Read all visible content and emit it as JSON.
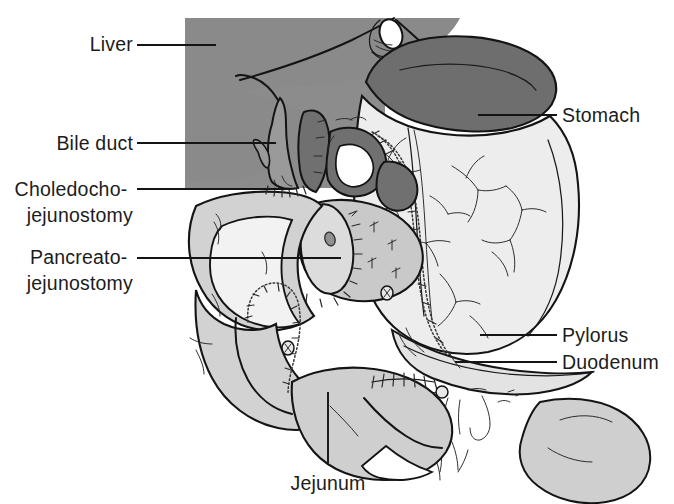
{
  "figure": {
    "background_color": "#ffffff",
    "width": 674,
    "height": 504
  },
  "palette": {
    "ink": "#141414",
    "liver_block": "#8c8c8c",
    "liver_organ": "#8a8a8a",
    "stomach_dark": "#6e6e6e",
    "bile_duct": "#9a9a9a",
    "duct_dark": "#707070",
    "bowel_mid": "#c9c9c9",
    "bowel_light": "#e3e3e3",
    "stomach_body": "#ededed",
    "pancreas_cut": "#cfcfcf",
    "white": "#ffffff"
  },
  "labels": [
    {
      "id": "liver",
      "name": "Liver",
      "lines": [
        "Liver"
      ],
      "side": "left",
      "text_anchor": "end",
      "text_x": 133,
      "text_y": 51,
      "leader": {
        "x1": 137,
        "y1": 45,
        "x2": 216,
        "y2": 45
      }
    },
    {
      "id": "bile-duct",
      "name": "Bile duct",
      "lines": [
        "Bile duct"
      ],
      "side": "left",
      "text_anchor": "end",
      "text_x": 133,
      "text_y": 150,
      "leader": {
        "x1": 137,
        "y1": 143,
        "x2": 276,
        "y2": 143
      }
    },
    {
      "id": "choledochojejunostomy",
      "name": "Choledochojejunostomy",
      "lines": [
        "Choledocho-",
        "jejunostomy"
      ],
      "side": "left",
      "text_anchor": "end",
      "text_x": 133,
      "text_y": 196,
      "line_height": 26,
      "leader": {
        "x1": 137,
        "y1": 189,
        "x2": 290,
        "y2": 189
      }
    },
    {
      "id": "pancreatojejunostomy",
      "name": "Pancreatojejunostomy",
      "lines": [
        "Pancreato-",
        "jejunostomy"
      ],
      "side": "left",
      "text_anchor": "end",
      "text_x": 133,
      "text_y": 264,
      "line_height": 26,
      "leader": {
        "x1": 137,
        "y1": 258,
        "x2": 341,
        "y2": 258
      }
    },
    {
      "id": "stomach",
      "name": "Stomach",
      "lines": [
        "Stomach"
      ],
      "side": "right",
      "text_anchor": "start",
      "text_x": 562,
      "text_y": 122,
      "leader": {
        "x1": 478,
        "y1": 115,
        "x2": 557,
        "y2": 115
      }
    },
    {
      "id": "pylorus",
      "name": "Pylorus",
      "lines": [
        "Pylorus"
      ],
      "side": "right",
      "text_anchor": "start",
      "text_x": 562,
      "text_y": 342,
      "leader": {
        "x1": 480,
        "y1": 335,
        "x2": 557,
        "y2": 335
      }
    },
    {
      "id": "duodenum",
      "name": "Duodenum",
      "lines": [
        "Duodenum"
      ],
      "side": "right",
      "text_anchor": "start",
      "text_x": 562,
      "text_y": 369,
      "leader": {
        "x1": 455,
        "y1": 362,
        "x2": 557,
        "y2": 362
      }
    },
    {
      "id": "jejunum",
      "name": "Jejunum",
      "lines": [
        "Jejunum"
      ],
      "side": "bottom",
      "text_anchor": "middle",
      "text_x": 328,
      "text_y": 490,
      "leader": {
        "x1": 328,
        "y1": 392,
        "x2": 328,
        "y2": 463
      }
    }
  ]
}
